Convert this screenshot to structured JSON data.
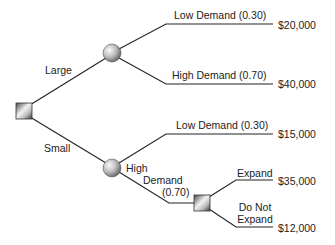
{
  "diagram": {
    "type": "decision-tree",
    "nodes": {
      "root": {
        "kind": "decision",
        "shape": "square"
      },
      "chance_large": {
        "kind": "chance",
        "shape": "circle"
      },
      "chance_small": {
        "kind": "chance",
        "shape": "circle"
      },
      "decision_expand": {
        "kind": "decision",
        "shape": "square"
      }
    },
    "branches": {
      "large": "Large",
      "small": "Small",
      "large_low": "Low Demand (0.30)",
      "large_high": "High Demand (0.70)",
      "small_low": "Low Demand (0.30)",
      "small_high_line1": "High",
      "small_high_line2": "Demand",
      "small_high_line3": "(0.70)",
      "expand": "Expand",
      "not_expand_line1": "Do Not",
      "not_expand_line2": "Expand"
    },
    "payoffs": {
      "large_low": "$20,000",
      "large_high": "$40,000",
      "small_low": "$15,000",
      "expand": "$35,000",
      "not_expand": "$12,000"
    }
  }
}
